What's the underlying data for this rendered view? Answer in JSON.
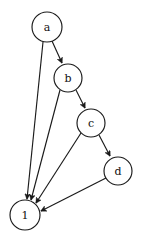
{
  "diagram": {
    "type": "directed-graph",
    "title": "",
    "background_color": "#ffffff",
    "stroke_color": "#1a1a1a",
    "node_fill_color": "#ffffff",
    "label_color": "#111111",
    "nodes": [
      {
        "id": "a",
        "label": "a",
        "cx": 47,
        "cy": 27,
        "r": 15
      },
      {
        "id": "b",
        "label": "b",
        "cx": 68,
        "cy": 78,
        "r": 14
      },
      {
        "id": "c",
        "label": "c",
        "cx": 91,
        "cy": 123,
        "r": 14
      },
      {
        "id": "d",
        "label": "d",
        "cx": 118,
        "cy": 171,
        "r": 14
      },
      {
        "id": "1",
        "label": "1",
        "cx": 25,
        "cy": 215,
        "r": 15
      }
    ],
    "edges": [
      {
        "from": "a",
        "to": "b",
        "directed": true
      },
      {
        "from": "a",
        "to": "1",
        "directed": true
      },
      {
        "from": "b",
        "to": "c",
        "directed": true
      },
      {
        "from": "b",
        "to": "1",
        "directed": true
      },
      {
        "from": "c",
        "to": "d",
        "directed": true
      },
      {
        "from": "c",
        "to": "1",
        "directed": true
      },
      {
        "from": "d",
        "to": "1",
        "directed": true
      }
    ]
  }
}
